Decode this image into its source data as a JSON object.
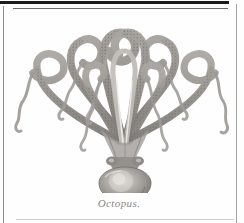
{
  "page": {
    "background_color": "#fefefe",
    "width": 244,
    "height": 223
  },
  "rules": {
    "top_thick_color": "#1d1c1a",
    "top_thin_color": "#6d6c6a",
    "left_color": "#8e8d8b",
    "right_color": "#a3a2a0",
    "bottom_color": "#cfcecc"
  },
  "plate": {
    "subject": "octopus",
    "style": "antique engraving, grayscale halftone scan",
    "ink_color": "#8e8c88",
    "ink_dark_color": "#6a6764",
    "mantle_fill_color": "#9a9793",
    "mantle_highlight_color": "#d9d7d2",
    "sucker_color": "#7c7976",
    "arm_count": 8,
    "alt_text": "Engraved illustration of an octopus with eight arching tentacles above a bulbous mantle"
  },
  "caption": {
    "text": "Octopus.",
    "color": "#8b8a88",
    "style": "italic"
  }
}
